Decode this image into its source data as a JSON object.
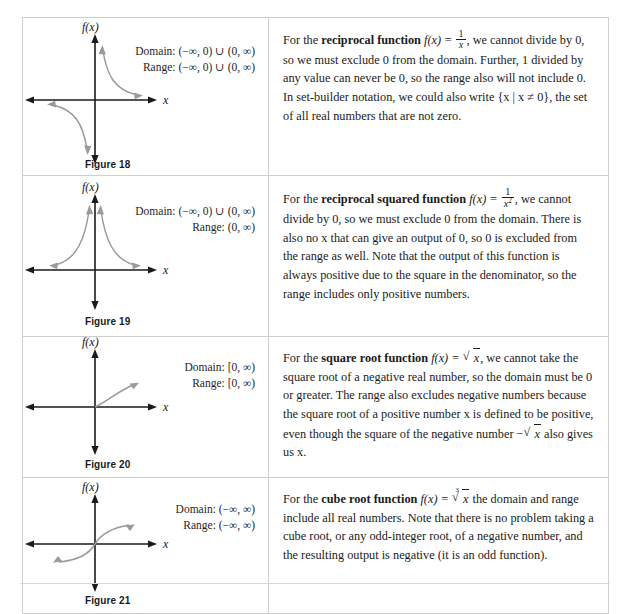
{
  "page": {
    "background_color": "#ffffff",
    "text_color": "#1b1b1b",
    "curve_color": "#8c8c8c",
    "axis_color": "#1a1a1a",
    "border_color": "#cfcfcf"
  },
  "rows": [
    {
      "figure_caption": "Figure 18",
      "y_axis_label": "f(x)",
      "x_axis_label": "x",
      "domain_label": "Domain: (−∞, 0) ∪ (0, ∞)",
      "range_label": "Range: (−∞, 0) ∪ (0, ∞)",
      "graph_type": "reciprocal",
      "paragraph_plain": "For the reciprocal function f(x) = 1/x, we cannot divide by 0, so we must exclude 0 from the domain. Further, 1 divided by any value can never be 0, so the range also will not include 0. In set-builder notation, we could also write {x | x ≠ 0}, the set of all real numbers that are not zero.",
      "text": {
        "lead": "For the ",
        "fn_name": "reciprocal function",
        "fn_def_prefix": " f(x) = ",
        "frac_num": "1",
        "frac_den": "x",
        "frac_den_sup": "",
        "after_formula": ", we cannot divide by 0, so we must exclude 0 from the domain. Further, 1 divided by any value can never be 0, so the range also will not include 0. In set-builder notation, we could also write {x | x ≠ 0}, the set of all real numbers that are not zero."
      }
    },
    {
      "figure_caption": "Figure 19",
      "y_axis_label": "f(x)",
      "x_axis_label": "x",
      "domain_label": "Domain: (−∞, 0) ∪ (0, ∞)",
      "range_label": "Range: (0, ∞)",
      "graph_type": "reciprocal-squared",
      "paragraph_plain": "For the reciprocal squared function f(x) = 1/x², we cannot divide by 0, so we must exclude 0 from the domain. There is also no x that can give an output of 0, so 0 is excluded from the range as well. Note that the output of this function is always positive due to the square in the denominator, so the range includes only positive numbers.",
      "text": {
        "lead": "For the ",
        "fn_name": "reciprocal squared function",
        "fn_def_prefix": " f(x) = ",
        "frac_num": "1",
        "frac_den": "x",
        "frac_den_sup": "2",
        "after_formula": ", we cannot divide by 0, so we must exclude 0 from the domain. There is also no x that can give an output of 0, so 0 is excluded from the range as well. Note that the output of this function is always positive due to the square in the denominator, so the range includes only positive numbers."
      }
    },
    {
      "figure_caption": "Figure 20",
      "y_axis_label": "f(x)",
      "x_axis_label": "x",
      "domain_label": "Domain: [0, ∞)",
      "range_label": "Range: [0, ∞)",
      "graph_type": "square-root",
      "paragraph_plain": "For the square root function f(x) = √x, we cannot take the square root of a negative real number, so the domain must be 0 or greater. The range also excludes negative numbers because the square root of a positive number x is defined to be positive, even though the square of the negative number −√x also gives us x.",
      "text": {
        "lead": "For the ",
        "fn_name": "square root function",
        "fn_def_prefix": " f(x) = ",
        "radicand": "x",
        "radical_index": "",
        "after_formula": ", we cannot take the square root of a negative real number, so the domain must be 0 or greater. The range also excludes negative numbers because the square root of a positive number x is defined to be positive, even though the square of the negative number ",
        "tail_prefix": "−",
        "tail_radicand": "x",
        "tail_after": " also gives us x."
      }
    },
    {
      "figure_caption": "Figure 21",
      "y_axis_label": "f(x)",
      "x_axis_label": "x",
      "domain_label": "Domain: (−∞, ∞)",
      "range_label": "Range: (−∞, ∞)",
      "graph_type": "cube-root",
      "paragraph_plain": "For the cube root function f(x) = ∛x the domain and range include all real numbers. Note that there is no problem taking a cube root, or any odd-integer root, of a negative number, and the resulting output is negative (it is an odd function).",
      "text": {
        "lead": "For the ",
        "fn_name": "cube root function",
        "fn_def_prefix": " f(x) = ",
        "radicand": "x",
        "radical_index": "3",
        "after_formula": " the domain and range include all real numbers. Note that there is no problem taking a cube root, or any odd-integer root, of a negative number, and the resulting output is negative (it is an odd function)."
      }
    }
  ]
}
